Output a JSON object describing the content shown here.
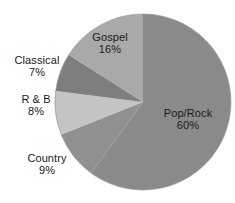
{
  "chart_data": {
    "type": "pie",
    "title": "",
    "subtitle": "",
    "xlabel": "",
    "ylabel": "",
    "legend_position": "none",
    "grid": false,
    "labels_show_percent": true,
    "start_angle_deg": 0,
    "direction": "clockwise",
    "categories": [
      "Pop/Rock",
      "Country",
      "R & B",
      "Classical",
      "Gospel"
    ],
    "values": [
      60,
      9,
      8,
      7,
      16
    ],
    "unit": "%",
    "slices": [
      {
        "name": "Pop/Rock",
        "label": "Pop/Rock",
        "value": 60,
        "value_text": "60%",
        "color": "#8a8a8a",
        "label_placement": "inside",
        "start_deg": 0,
        "end_deg": 216
      },
      {
        "name": "Country",
        "label": "Country",
        "value": 9,
        "value_text": "9%",
        "color": "#909090",
        "label_placement": "outside",
        "start_deg": 216,
        "end_deg": 248.4
      },
      {
        "name": "R & B",
        "label": "R & B",
        "value": 8,
        "value_text": "8%",
        "color": "#c4c4c4",
        "label_placement": "outside",
        "start_deg": 248.4,
        "end_deg": 277.2
      },
      {
        "name": "Classical",
        "label": "Classical",
        "value": 7,
        "value_text": "7%",
        "color": "#7e7e7e",
        "label_placement": "outside",
        "start_deg": 277.2,
        "end_deg": 302.4
      },
      {
        "name": "Gospel",
        "label": "Gospel",
        "value": 16,
        "value_text": "16%",
        "color": "#a9a9a9",
        "label_placement": "inside",
        "start_deg": 302.4,
        "end_deg": 360
      }
    ],
    "geometry": {
      "center_x": 143,
      "center_y": 102,
      "radius": 88
    },
    "colors": {
      "background": "#ffffff",
      "text": "#1a1a1a",
      "outline": "#9a9a9a"
    }
  }
}
